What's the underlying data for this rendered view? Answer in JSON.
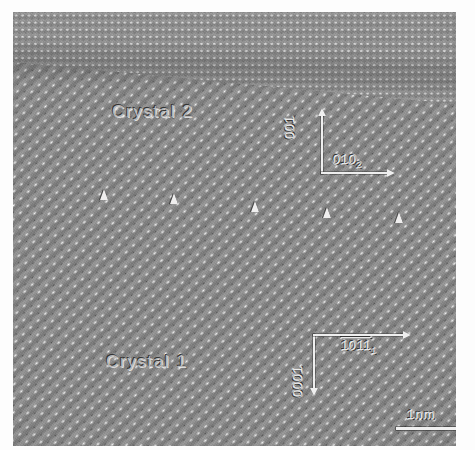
{
  "image": {
    "type": "hrtem-micrograph",
    "description": "High-resolution transmission electron micrograph of a grain boundary between two crystals",
    "background_color": "#8a8a8a",
    "frame_color": "#ffffff"
  },
  "labels": {
    "crystal_upper": "Crystal 2",
    "crystal_lower": "Crystal 1"
  },
  "axes": {
    "crystal2": {
      "vertical": {
        "label": "001",
        "direction": "up"
      },
      "horizontal": {
        "label": "010",
        "subscript": "2",
        "direction": "right"
      }
    },
    "crystal1": {
      "vertical": {
        "label": "0001",
        "direction": "down"
      },
      "horizontal": {
        "label": "1011",
        "subscript": "1",
        "direction": "right"
      }
    }
  },
  "scalebar": {
    "text": "1nm",
    "length_px": 60
  },
  "markers": {
    "name": "boundary-arrowheads",
    "count": 5,
    "glyph": "triangle-up",
    "positions": [
      {
        "x": 100,
        "y": 189
      },
      {
        "x": 170,
        "y": 193
      },
      {
        "x": 251,
        "y": 201
      },
      {
        "x": 323,
        "y": 207
      },
      {
        "x": 395,
        "y": 212
      }
    ]
  },
  "lattice": {
    "crystal2": {
      "orientation_deg": 0,
      "motif": "rectangular-rows"
    },
    "crystal1": {
      "orientation_deg": -43,
      "motif": "diagonal-rows"
    }
  }
}
